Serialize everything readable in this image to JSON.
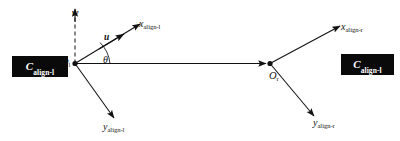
{
  "figure": {
    "type": "diagram",
    "background_color": "#ffffff",
    "line_color": "#111111",
    "box_fill_color": "#0a0a0a",
    "box_text_color": "#ffffff"
  },
  "frames": [
    {
      "id": "left",
      "box_label_base": "C",
      "box_label_sub": "align-l",
      "origin_base": "O",
      "origin_sub": "l",
      "x_axis_base": "x",
      "x_axis_sub": "align-l",
      "y_axis_base": "y",
      "y_axis_sub": "align-l"
    },
    {
      "id": "right",
      "box_label_base": "C",
      "box_label_sub": "align-l",
      "origin_base": "O",
      "origin_sub": "r",
      "x_axis_base": "x",
      "x_axis_sub": "align-r",
      "y_axis_base": "y",
      "y_axis_sub": "align-r"
    }
  ],
  "vectors": [
    {
      "id": "w",
      "label_base": "w",
      "style": "dashed-vertical-up"
    },
    {
      "id": "u",
      "label_base": "u",
      "style": "solid-along-x-left"
    }
  ],
  "angle": {
    "label_base": "θ",
    "between": "baseline and x-align-l axis"
  },
  "baseline": {
    "from": "O-l",
    "to": "O-r",
    "style": "solid-horizontal-arrow"
  }
}
